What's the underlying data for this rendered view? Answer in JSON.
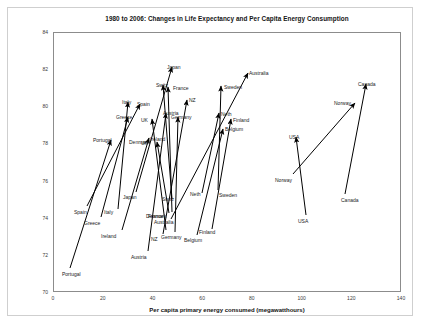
{
  "chart_data": {
    "type": "scatter",
    "title": "1980 to 2006: Changes in Life Expectancy and Per Capita Energy Consumption",
    "xlabel": "Per capita primary energy consumed (megawatthours)",
    "ylabel": "Life expectancy (years)",
    "xlim": [
      0,
      140
    ],
    "ylim": [
      70,
      84
    ],
    "xticks": [
      "0",
      "20",
      "40",
      "60",
      "80",
      "100",
      "120",
      "140"
    ],
    "yticks": [
      "70",
      "72",
      "74",
      "76",
      "78",
      "80",
      "82",
      "84"
    ],
    "grid": false,
    "legend": "none",
    "annotation": "Each arrow runs from a country's 1980 position to its 2006 position.",
    "series": [
      {
        "name": "Portugal",
        "x_start": 9,
        "y_start": 71.0,
        "x_end": 25,
        "y_end": 78.1
      },
      {
        "name": "Spain",
        "x_start": 18,
        "y_start": 74.7,
        "x_end": 37,
        "y_end": 80.8
      },
      {
        "name": "Greece",
        "x_start": 16,
        "y_start": 74.3,
        "x_end": 34,
        "y_end": 79.2
      },
      {
        "name": "Italy",
        "x_start": 26,
        "y_start": 74.6,
        "x_end": 34,
        "y_end": 80.9
      },
      {
        "name": "Ireland",
        "x_start": 25,
        "y_start": 73.4,
        "x_end": 44,
        "y_end": 78.6
      },
      {
        "name": "Japan",
        "x_start": 32,
        "y_start": 76.4,
        "x_end": 49,
        "y_end": 82.3
      },
      {
        "name": "Austria",
        "x_start": 37,
        "y_start": 72.4,
        "x_end": 48,
        "y_end": 79.6
      },
      {
        "name": "Switz",
        "x_start": 47,
        "y_start": 75.8,
        "x_end": 45,
        "y_end": 81.3
      },
      {
        "name": "Denmark",
        "x_start": 45,
        "y_start": 74.9,
        "x_end": 42,
        "y_end": 78.3
      },
      {
        "name": "Australia",
        "x_start": 45,
        "y_start": 74.6,
        "x_end": 71,
        "y_end": 81.7
      },
      {
        "name": "Germany",
        "x_start": 46,
        "y_start": 73.8,
        "x_end": 50,
        "y_end": 79.4
      },
      {
        "name": "NZ",
        "x_start": 41,
        "y_start": 73.7,
        "x_end": 54,
        "y_end": 80.2
      },
      {
        "name": "UK",
        "x_start": 44,
        "y_start": 73.9,
        "x_end": 45,
        "y_end": 79.3
      },
      {
        "name": "France",
        "x_start": 45,
        "y_start": 74.8,
        "x_end": 51,
        "y_end": 81.1
      },
      {
        "name": "Belgium",
        "x_start": 56,
        "y_start": 73.6,
        "x_end": 65,
        "y_end": 79.4
      },
      {
        "name": "Finland",
        "x_start": 63,
        "y_start": 73.8,
        "x_end": 67,
        "y_end": 79.5
      },
      {
        "name": "Neth",
        "x_start": 57,
        "y_start": 75.9,
        "x_end": 63,
        "y_end": 80.0
      },
      {
        "name": "Sweden",
        "x_start": 64,
        "y_start": 75.3,
        "x_end": 65,
        "y_end": 80.9
      },
      {
        "name": "USA",
        "x_start": 95,
        "y_start": 73.6,
        "x_end": 92,
        "y_end": 77.9
      },
      {
        "name": "Norway",
        "x_start": 90,
        "y_start": 75.9,
        "x_end": 116,
        "y_end": 80.5
      },
      {
        "name": "Canada",
        "x_start": 110,
        "y_start": 74.1,
        "x_end": 120,
        "y_end": 81.8
      }
    ],
    "arrows": [
      {
        "name": "Portugal",
        "x1": 70,
        "y1": 268,
        "x2": 111,
        "y2": 140,
        "label_start_x": 62,
        "label_start_y": 271,
        "label_end_x": 93,
        "label_end_y": 137
      },
      {
        "name": "Spain",
        "x1": 87,
        "y1": 206,
        "x2": 140,
        "y2": 104,
        "label_start_x": 74,
        "label_start_y": 209,
        "label_end_x": 137,
        "label_end_y": 101
      },
      {
        "name": "Greece",
        "x1": 101,
        "y1": 217,
        "x2": 128,
        "y2": 117,
        "label_start_x": 84,
        "label_start_y": 220,
        "label_end_x": 116,
        "label_end_y": 114
      },
      {
        "name": "Italy",
        "x1": 118,
        "y1": 209,
        "x2": 128,
        "y2": 102,
        "label_start_x": 104,
        "label_start_y": 209,
        "label_end_x": 122,
        "label_end_y": 99
      },
      {
        "name": "Ireland",
        "x1": 122,
        "y1": 230,
        "x2": 149,
        "y2": 138,
        "label_start_x": 101,
        "label_start_y": 233,
        "label_end_x": 150,
        "label_end_y": 136
      },
      {
        "name": "Japan",
        "x1": 136,
        "y1": 192,
        "x2": 172,
        "y2": 67,
        "label_start_x": 123,
        "label_start_y": 194,
        "label_end_x": 167,
        "label_end_y": 64
      },
      {
        "name": "Austria",
        "x1": 148,
        "y1": 251,
        "x2": 166,
        "y2": 113,
        "label_start_x": 131,
        "label_start_y": 254,
        "label_end_x": 163,
        "label_end_y": 110
      },
      {
        "name": "Switz",
        "x1": 172,
        "y1": 199,
        "x2": 163,
        "y2": 85,
        "label_start_x": 162,
        "label_start_y": 196,
        "label_end_x": 156,
        "label_end_y": 82
      },
      {
        "name": "Denmark",
        "x1": 169,
        "y1": 213,
        "x2": 157,
        "y2": 142,
        "label_start_x": 146,
        "label_start_y": 213,
        "label_end_x": 129,
        "label_end_y": 139
      },
      {
        "name": "Australia",
        "x1": 171,
        "y1": 219,
        "x2": 248,
        "y2": 73,
        "label_start_x": 154,
        "label_start_y": 219,
        "label_end_x": 249,
        "label_end_y": 70
      },
      {
        "name": "Germany",
        "x1": 175,
        "y1": 232,
        "x2": 178,
        "y2": 117,
        "label_start_x": 161,
        "label_start_y": 234,
        "label_end_x": 171,
        "label_end_y": 114
      },
      {
        "name": "NZ",
        "x1": 163,
        "y1": 234,
        "x2": 187,
        "y2": 100,
        "label_start_x": 151,
        "label_start_y": 236,
        "label_end_x": 189,
        "label_end_y": 97
      },
      {
        "name": "UK",
        "x1": 166,
        "y1": 230,
        "x2": 152,
        "y2": 119,
        "label_start_x": 141,
        "label_start_y": 140,
        "label_end_x": 141,
        "label_end_y": 117
      },
      {
        "name": "France",
        "x1": 172,
        "y1": 212,
        "x2": 168,
        "y2": 87,
        "label_start_x": 148,
        "label_start_y": 213,
        "label_end_x": 173,
        "label_end_y": 85
      },
      {
        "name": "Belgium",
        "x1": 197,
        "y1": 235,
        "x2": 223,
        "y2": 129,
        "label_start_x": 184,
        "label_start_y": 237,
        "label_end_x": 225,
        "label_end_y": 126
      },
      {
        "name": "Finland",
        "x1": 212,
        "y1": 229,
        "x2": 231,
        "y2": 119,
        "label_start_x": 199,
        "label_start_y": 229,
        "label_end_x": 233,
        "label_end_y": 117
      },
      {
        "name": "Neth",
        "x1": 202,
        "y1": 193,
        "x2": 219,
        "y2": 113,
        "label_start_x": 190,
        "label_start_y": 191,
        "label_end_x": 221,
        "label_end_y": 111
      },
      {
        "name": "Sweden",
        "x1": 218,
        "y1": 190,
        "x2": 221,
        "y2": 86,
        "label_start_x": 219,
        "label_start_y": 192,
        "label_end_x": 224,
        "label_end_y": 84
      },
      {
        "name": "USA",
        "x1": 306,
        "y1": 215,
        "x2": 296,
        "y2": 137,
        "label_start_x": 298,
        "label_start_y": 218,
        "label_end_x": 289,
        "label_end_y": 134
      },
      {
        "name": "Norway",
        "x1": 293,
        "y1": 174,
        "x2": 355,
        "y2": 103,
        "label_start_x": 275,
        "label_start_y": 177,
        "label_end_x": 334,
        "label_end_y": 100
      },
      {
        "name": "Canada",
        "x1": 345,
        "y1": 194,
        "x2": 366,
        "y2": 84,
        "label_start_x": 341,
        "label_start_y": 197,
        "label_end_x": 358,
        "label_end_y": 81
      }
    ]
  },
  "colors": {
    "arrow": "#000000",
    "axis": "#8c8c8c",
    "frame": "#cfcfcf",
    "text": "#1a1a1a",
    "background": "#ffffff"
  }
}
